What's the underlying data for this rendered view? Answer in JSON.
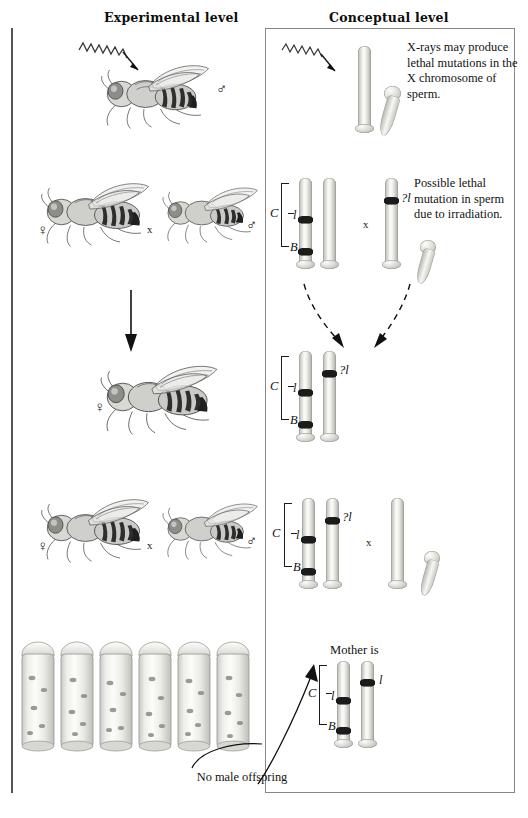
{
  "figure": {
    "title_left": "Experimental level",
    "title_right": "Conceptual level"
  },
  "panels": [
    {
      "id": "irradiation",
      "experimental": {
        "icon": "x-ray-zigzag-arrow",
        "fly": {
          "sex_symbol": "♂",
          "sex": "male"
        }
      },
      "conceptual": {
        "caption": "X-rays may produce lethal mutations in the X chromosome of sperm.",
        "chromosomes": [
          {
            "label": "X",
            "bands": []
          }
        ],
        "sperm_shape": "Y-chromosome"
      }
    },
    {
      "id": "cross-p1",
      "experimental": {
        "female_symbol": "♀",
        "cross_symbol": "x",
        "male_symbol": "♂"
      },
      "conceptual": {
        "caption": "Possible lethal mutation in sperm due to irradiation.",
        "cross_symbol": "x",
        "bracket_label": "C",
        "female_gene_labels": [
          "l",
          "B"
        ],
        "male_gene_label": "?l"
      }
    },
    {
      "id": "f1-female",
      "experimental": {
        "arrow": "down-arrow",
        "female_symbol": "♀"
      },
      "conceptual": {
        "bracket_label": "C",
        "gene_labels": [
          "l",
          "B"
        ],
        "mutant_label": "?l",
        "inheritance_arrows": "dashed"
      }
    },
    {
      "id": "cross-f1",
      "experimental": {
        "female_symbol": "♀",
        "cross_symbol": "x",
        "male_symbol": "♂"
      },
      "conceptual": {
        "cross_symbol": "x",
        "bracket_label": "C",
        "gene_labels": [
          "l",
          "B"
        ],
        "mutant_label": "?l"
      }
    },
    {
      "id": "result",
      "experimental": {
        "vial_count": 6,
        "annotation": "No male offspring"
      },
      "conceptual": {
        "heading": "Mother is",
        "bracket_label": "C",
        "gene_labels": [
          "l",
          "B"
        ],
        "homolog_label": "l"
      }
    }
  ],
  "colors": {
    "ink": "#111111",
    "rule": "#555555",
    "box_border": "#888888",
    "band": "#1b1b1b",
    "chromosome_light": "#fbfbf8",
    "chromosome_shadow": "#a9a9a3",
    "background": "#ffffff"
  }
}
